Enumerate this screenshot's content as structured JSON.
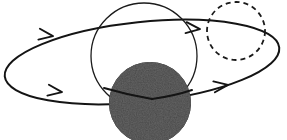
{
  "figure": {
    "canvas": {
      "width": 287,
      "height": 140,
      "background": "#ffffff"
    },
    "colors": {
      "stroke": "#1b1b1b",
      "orbit_stroke": "#141414",
      "body_fill": "#151515",
      "body_speckle": "#3a3a3a",
      "dashed_stroke": "#1b1b1b",
      "background": "#ffffff"
    },
    "strokes": {
      "orbit_width": 2.0,
      "circle_width": 1.3,
      "dashed_width": 1.8,
      "dash_pattern": "5 4"
    }
  },
  "elements": {
    "orbit_ellipse": {
      "name": "orbit-ellipse",
      "type": "ellipse",
      "cx": 142,
      "cy": 62,
      "rx": 138,
      "ry": 40,
      "rotation_deg": -6,
      "filled": false
    },
    "primary_circle": {
      "name": "primary-circle",
      "type": "circle",
      "cx": 144,
      "cy": 56,
      "r": 53,
      "filled": false
    },
    "occulting_body": {
      "name": "occulting-body",
      "type": "circle",
      "cx": 150,
      "cy": 103,
      "r": 41,
      "filled": true,
      "texture": "speckled"
    },
    "dashed_circle": {
      "name": "dashed-circle",
      "type": "circle",
      "cx": 236,
      "cy": 31,
      "r": 29,
      "filled": false,
      "dashed": true
    }
  },
  "arrows": [
    {
      "id": "arrow-upper-left",
      "label": "upper-left direction marker",
      "x": 52,
      "y": 36,
      "angle_deg": 188,
      "direction": "left"
    },
    {
      "id": "arrow-upper-right",
      "label": "upper-right direction marker",
      "x": 199,
      "y": 29,
      "angle_deg": 186,
      "direction": "left"
    },
    {
      "id": "arrow-lower-left",
      "label": "lower-left direction marker",
      "x": 61,
      "y": 92,
      "angle_deg": 8,
      "direction": "right"
    },
    {
      "id": "arrow-lower-right",
      "label": "lower-right direction marker",
      "x": 227,
      "y": 85,
      "angle_deg": 352,
      "direction": "right"
    }
  ]
}
